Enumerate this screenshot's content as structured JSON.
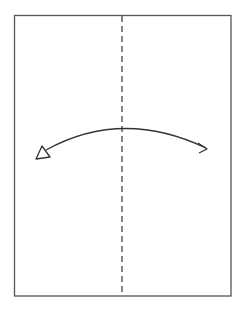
{
  "diagram": {
    "type": "paper-fold-instruction",
    "paper": {
      "x": 14,
      "y": 15,
      "width": 217,
      "height": 281,
      "stroke": "#555555"
    },
    "fold_line": {
      "style": "valley-dashed",
      "x": 122,
      "y1": 15,
      "y2": 296,
      "stroke": "#444444"
    },
    "arrow": {
      "from": [
        44,
        152
      ],
      "control": [
        122,
        110
      ],
      "to": [
        207,
        149
      ],
      "start_head": "hollow-triangle",
      "end_head": "open-chevron",
      "stroke": "#333333"
    }
  }
}
